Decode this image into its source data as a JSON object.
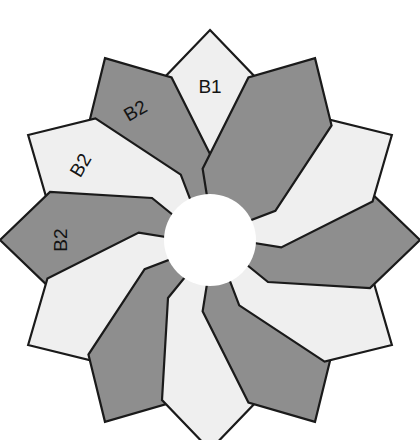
{
  "figure": {
    "background_color": "#ffffff",
    "outline_color": "#1a1a1a",
    "light_fill": "#EFEFEF",
    "dark_fill": "#8E8E8E",
    "center": {
      "cx": 210,
      "cy": 240,
      "hole_radius": 46
    },
    "petal_count": 12,
    "petals": [
      {
        "index": 0,
        "angle_deg": 0,
        "fill": "light",
        "label": "B1",
        "label_rotation": 0,
        "label_radius": 152
      },
      {
        "index": 1,
        "angle_deg": -30,
        "fill": "dark",
        "label": "B2",
        "label_rotation": -30,
        "label_radius": 148
      },
      {
        "index": 2,
        "angle_deg": -60,
        "fill": "light",
        "label": "B2",
        "label_rotation": -60,
        "label_radius": 148
      },
      {
        "index": 3,
        "angle_deg": -90,
        "fill": "dark",
        "label": "B2",
        "label_rotation": -90,
        "label_radius": 148
      },
      {
        "index": 4,
        "angle_deg": -120,
        "fill": "light",
        "label": "",
        "label_rotation": -120,
        "label_radius": 148
      },
      {
        "index": 5,
        "angle_deg": -150,
        "fill": "dark",
        "label": "",
        "label_rotation": -150,
        "label_radius": 148
      },
      {
        "index": 6,
        "angle_deg": 180,
        "fill": "light",
        "label": "",
        "label_rotation": 180,
        "label_radius": 148
      },
      {
        "index": 7,
        "angle_deg": 150,
        "fill": "dark",
        "label": "",
        "label_rotation": 150,
        "label_radius": 148
      },
      {
        "index": 8,
        "angle_deg": 120,
        "fill": "light",
        "label": "",
        "label_rotation": 120,
        "label_radius": 148
      },
      {
        "index": 9,
        "angle_deg": 90,
        "fill": "dark",
        "label": "",
        "label_rotation": 90,
        "label_radius": 148
      },
      {
        "index": 10,
        "angle_deg": 60,
        "fill": "light",
        "label": "",
        "label_rotation": 60,
        "label_radius": 148
      },
      {
        "index": 11,
        "angle_deg": 30,
        "fill": "dark",
        "label": "",
        "label_rotation": 30,
        "label_radius": 148
      }
    ],
    "petal_outline_points": "0,-210 48,-160 42,-58 16,-26 -16,-26 -42,-58 -48,-160",
    "legend": {
      "b1_label": "B1",
      "b2_label": "B2"
    }
  }
}
